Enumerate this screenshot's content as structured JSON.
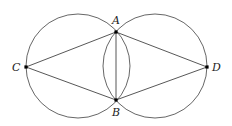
{
  "figure": {
    "type": "geometric-construction",
    "stroke_color": "#555555",
    "point_color": "#000000"
  },
  "circles": [
    {
      "name": "left-circle",
      "cx": 78,
      "cy": 66,
      "r": 52
    },
    {
      "name": "right-circle",
      "cx": 155,
      "cy": 66,
      "r": 52
    }
  ],
  "points": {
    "A": {
      "label": "A",
      "x": 116,
      "y": 32,
      "lx": 112,
      "ly": 24
    },
    "B": {
      "label": "B",
      "x": 116,
      "y": 100,
      "lx": 112,
      "ly": 116
    },
    "C": {
      "label": "C",
      "x": 26,
      "y": 67,
      "lx": 12,
      "ly": 71
    },
    "D": {
      "label": "D",
      "x": 207,
      "y": 67,
      "lx": 212,
      "ly": 71
    }
  },
  "segments": [
    [
      "A",
      "C"
    ],
    [
      "C",
      "B"
    ],
    [
      "A",
      "D"
    ],
    [
      "D",
      "B"
    ],
    [
      "A",
      "B"
    ]
  ]
}
